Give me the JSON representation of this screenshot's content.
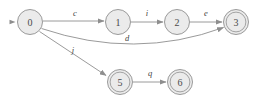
{
  "diagram": {
    "type": "state-machine",
    "colors": {
      "node_fill": "#ebebeb",
      "node_stroke": "#9a9a9a",
      "edge_stroke": "#8e8e8e",
      "label_text": "#3f3f3f",
      "background": "#ffffff"
    },
    "nodes": [
      {
        "id": "0",
        "label": "0",
        "cx": 30,
        "cy": 22,
        "r": 12.5,
        "accepting": false,
        "start": true
      },
      {
        "id": "1",
        "label": "1",
        "cx": 118,
        "cy": 22,
        "r": 12.5,
        "accepting": false,
        "start": false
      },
      {
        "id": "2",
        "label": "2",
        "cx": 177,
        "cy": 22,
        "r": 12.5,
        "accepting": false,
        "start": false
      },
      {
        "id": "3",
        "label": "3",
        "cx": 236,
        "cy": 22,
        "r": 12.5,
        "accepting": true,
        "start": false
      },
      {
        "id": "5",
        "label": "5",
        "cx": 120,
        "cy": 82,
        "r": 12.5,
        "accepting": true,
        "start": false
      },
      {
        "id": "6",
        "label": "6",
        "cx": 180,
        "cy": 82,
        "r": 12.5,
        "accepting": true,
        "start": false
      }
    ],
    "edges": [
      {
        "id": "e-0-1",
        "from": "0",
        "to": "1",
        "label": "c",
        "label_x": 75,
        "label_y": 13,
        "path": "M 42.8 21 L 104 21"
      },
      {
        "id": "e-1-2",
        "from": "1",
        "to": "2",
        "label": "i",
        "label_x": 147,
        "label_y": 13,
        "path": "M 130.8 22 L 163 22"
      },
      {
        "id": "e-2-3",
        "from": "2",
        "to": "3",
        "label": "e",
        "label_x": 206,
        "label_y": 13,
        "path": "M 189.8 22 L 222 22"
      },
      {
        "id": "e-0-3",
        "from": "0",
        "to": "3",
        "label": "d",
        "label_x": 127,
        "label_y": 38,
        "path": "M 41.5 28.5 Q 135 60 223.5 27.5"
      },
      {
        "id": "e-0-5",
        "from": "0",
        "to": "5",
        "label": "j",
        "label_x": 73,
        "label_y": 50,
        "path": "M 39.5 31.5 L 106 75.5"
      },
      {
        "id": "e-5-6",
        "from": "5",
        "to": "6",
        "label": "q",
        "label_x": 150,
        "label_y": 73,
        "path": "M 132.8 82 L 166 82"
      }
    ],
    "start_marker": {
      "x": 13,
      "y": 22,
      "label": "start-arrow"
    }
  }
}
